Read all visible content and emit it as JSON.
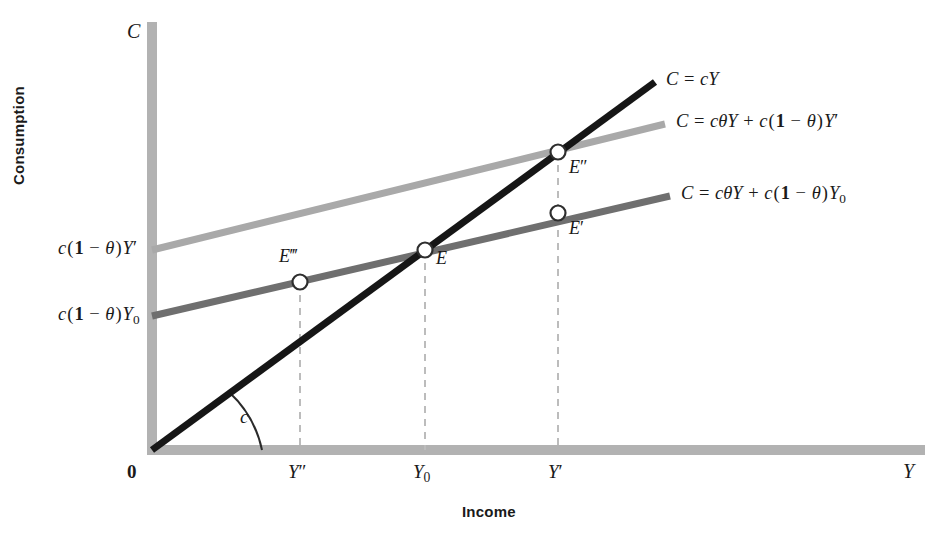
{
  "figure": {
    "domain": "economics-consumption-function-diagram",
    "axes": {
      "y_axis_letter": "C",
      "x_axis_letter": "Y",
      "y_axis_title": "Consumption",
      "x_axis_title": "Income",
      "origin_label": "0"
    },
    "x_ticks": [
      {
        "id": "tick-y-double-prime",
        "label_html": "Y″",
        "x": 300
      },
      {
        "id": "tick-y-zero",
        "label_html": "Y₀",
        "x": 425
      },
      {
        "id": "tick-y-prime",
        "label_html": "Y′",
        "x": 558
      }
    ],
    "y_intercept_labels": [
      {
        "id": "intercept-upper",
        "label_html": "c(1 − θ)Y′",
        "y": 250
      },
      {
        "id": "intercept-lower",
        "label_html": "c(1 − θ)Y₀",
        "y": 316
      }
    ],
    "angle_label": "c",
    "lines": [
      {
        "id": "line-45-degree",
        "name": "consumption-line-cY",
        "equation_html": "C = cY",
        "color": "#161616",
        "width": 7,
        "from": [
          152,
          450
        ],
        "to": [
          655,
          82
        ],
        "label_pos": [
          666,
          74
        ]
      },
      {
        "id": "line-light-grey",
        "name": "consumption-line-high-income",
        "equation_html": "C = cθY + c(1 − θ)Y′",
        "color": "#a9a9a9",
        "width": 7,
        "from": [
          152,
          250
        ],
        "to": [
          665,
          124
        ],
        "label_pos": [
          676,
          117
        ]
      },
      {
        "id": "line-dark-grey",
        "name": "consumption-line-base-income",
        "equation_html": "C = cθY + c(1 − θ)Y₀",
        "color": "#6f6f6f",
        "width": 7,
        "from": [
          152,
          316
        ],
        "to": [
          670,
          196
        ],
        "label_pos": [
          681,
          189
        ]
      }
    ],
    "points": [
      {
        "id": "point-E-triple-prime",
        "label_html": "E‴",
        "x": 300,
        "y": 282,
        "label_pos": [
          281,
          254
        ]
      },
      {
        "id": "point-E",
        "label_html": "E",
        "x": 425,
        "y": 250,
        "label_pos": [
          436,
          254
        ]
      },
      {
        "id": "point-E-double-prime",
        "label_html": "E″",
        "x": 558,
        "y": 152,
        "label_pos": [
          569,
          162
        ]
      },
      {
        "id": "point-E-prime",
        "label_html": "E′",
        "x": 558,
        "y": 213,
        "label_pos": [
          569,
          223
        ]
      }
    ],
    "dashed_guides": [
      {
        "id": "guide-y-double-prime",
        "x": 300,
        "top": 282,
        "bottom": 450
      },
      {
        "id": "guide-y-zero",
        "x": 425,
        "top": 250,
        "bottom": 450
      },
      {
        "id": "guide-y-prime",
        "x": 558,
        "top": 152,
        "bottom": 450
      }
    ],
    "colors": {
      "axis_bar": "#b2b2b2",
      "line_black": "#161616",
      "line_light_grey": "#a9a9a9",
      "line_dark_grey": "#6f6f6f",
      "dash_guide": "#b9b9b9",
      "marker_fill": "#ffffff",
      "text": "#1a1a1a",
      "background": "#ffffff"
    },
    "geometry": {
      "origin": [
        152,
        450
      ],
      "y_axis_top": 22,
      "x_axis_right": 925,
      "axis_thickness": 10
    }
  },
  "chart_data": {
    "type": "line",
    "title": "",
    "xlabel": "Income",
    "ylabel": "Consumption",
    "x_tick_labels": [
      "0",
      "Y″",
      "Y₀",
      "Y′"
    ],
    "y_tick_labels": [
      "c(1 − θ)Y₀",
      "c(1 − θ)Y′"
    ],
    "grid": false,
    "legend": "inline-right-of-lines",
    "series": [
      {
        "name": "C = cY",
        "color": "#161616",
        "intercept": 0,
        "slope": "c",
        "points_px": [
          [
            152,
            450
          ],
          [
            655,
            82
          ]
        ]
      },
      {
        "name": "C = cθY + c(1 − θ)Y′",
        "color": "#a9a9a9",
        "intercept": "c(1 − θ)Y′",
        "slope": "cθ",
        "points_px": [
          [
            152,
            250
          ],
          [
            665,
            124
          ]
        ]
      },
      {
        "name": "C = cθY + c(1 − θ)Y₀",
        "color": "#6f6f6f",
        "intercept": "c(1 − θ)Y₀",
        "slope": "cθ",
        "points_px": [
          [
            152,
            316
          ],
          [
            670,
            196
          ]
        ]
      }
    ],
    "annotations": [
      {
        "text": "E‴",
        "at": "Y″ on dark-grey line"
      },
      {
        "text": "E",
        "at": "Y₀ intersection of cY and dark-grey line"
      },
      {
        "text": "E″",
        "at": "Y′ intersection of cY and light-grey line"
      },
      {
        "text": "E′",
        "at": "Y′ on dark-grey line"
      },
      {
        "text": "c",
        "at": "angle between x-axis and cY line at origin"
      }
    ]
  }
}
